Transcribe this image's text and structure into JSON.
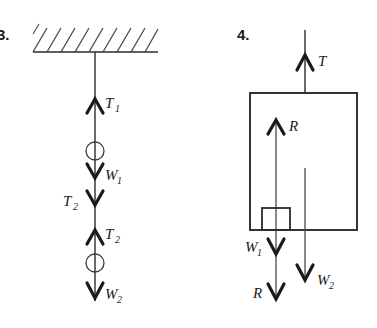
{
  "figure": {
    "background_color": "#ffffff",
    "ink_color": "#1a1a1a",
    "width": 377,
    "height": 328
  },
  "diagrams": [
    {
      "id": "diagram-3",
      "number": "3.",
      "description": "Two masses hanging in series from a hatched ceiling",
      "support": {
        "type": "hatched-ceiling",
        "hatch_direction": "forward-slash",
        "line_x_start": 33,
        "line_x_end": 158,
        "line_y": 52,
        "hatch_count": 9
      },
      "rope_x": 95,
      "forces": [
        {
          "name": "T1",
          "label": "T",
          "subscript": "1",
          "direction": "up",
          "label_side": "right",
          "head_y": 100
        },
        {
          "name": "W1",
          "label": "W",
          "subscript": "1",
          "direction": "down",
          "label_side": "right",
          "head_y": 176
        },
        {
          "name": "T2a",
          "label": "T",
          "subscript": "2",
          "direction": "down",
          "label_side": "left",
          "head_y": 203
        },
        {
          "name": "T2b",
          "label": "T",
          "subscript": "2",
          "direction": "up",
          "label_side": "right",
          "head_y": 231
        },
        {
          "name": "W2",
          "label": "W",
          "subscript": "2",
          "direction": "down",
          "label_side": "right",
          "head_y": 295
        }
      ],
      "bodies": [
        {
          "name": "mass-1-ring",
          "shape": "circle",
          "cx": 95,
          "cy": 151,
          "r": 9
        },
        {
          "name": "mass-2-ring",
          "shape": "circle",
          "cx": 95,
          "cy": 263,
          "r": 9
        }
      ]
    },
    {
      "id": "diagram-4",
      "number": "4.",
      "description": "Block resting inside a lift/box suspended by a cable",
      "outer_box": {
        "x": 250,
        "y": 93,
        "width": 107,
        "height": 137
      },
      "inner_box": {
        "x": 262,
        "y": 208,
        "width": 28,
        "height": 22
      },
      "cable_x": 305,
      "left_line_x": 276,
      "right_line_x": 305,
      "forces": [
        {
          "name": "T",
          "label": "T",
          "subscript": "",
          "direction": "up",
          "label_side": "right",
          "head_y": 56,
          "x": 305
        },
        {
          "name": "R-up",
          "label": "R",
          "subscript": "",
          "direction": "up",
          "label_side": "right",
          "head_y": 121,
          "x": 276
        },
        {
          "name": "W1",
          "label": "W",
          "subscript": "1",
          "direction": "down",
          "label_side": "left",
          "head_y": 252,
          "x": 276
        },
        {
          "name": "R-down",
          "label": "R",
          "subscript": "",
          "direction": "down",
          "label_side": "left",
          "head_y": 297,
          "x": 276
        },
        {
          "name": "W2",
          "label": "W",
          "subscript": "2",
          "direction": "down",
          "label_side": "right",
          "head_y": 277,
          "x": 305
        }
      ]
    }
  ],
  "labels": {
    "fig3_number": "3.",
    "fig4_number": "4.",
    "T1_base": "T",
    "T1_sub": "1",
    "W1_base": "W",
    "W1_sub": "1",
    "T2a_base": "T",
    "T2a_sub": "2",
    "T2b_base": "T",
    "T2b_sub": "2",
    "W2_base": "W",
    "W2_sub": "2",
    "T_plain": "T",
    "R_up": "R",
    "R_down": "R",
    "W1b_base": "W",
    "W1b_sub": "1",
    "W2b_base": "W",
    "W2b_sub": "2"
  }
}
